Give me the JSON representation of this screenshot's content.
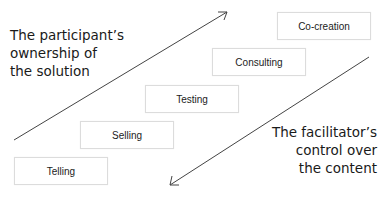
{
  "diagram": {
    "top_left_label": [
      "The participant’s",
      "ownership of",
      "the solution"
    ],
    "bottom_right_label": [
      "The facilitator’s",
      "control over",
      "the content"
    ],
    "steps": [
      {
        "label": "Telling"
      },
      {
        "label": "Selling"
      },
      {
        "label": "Testing"
      },
      {
        "label": "Consulting"
      },
      {
        "label": "Co-creation"
      }
    ],
    "arrows": [
      {
        "name": "participant-ownership-arrow",
        "direction": "up-right"
      },
      {
        "name": "facilitator-control-arrow",
        "direction": "down-left"
      }
    ],
    "colors": {
      "line": "#444444",
      "box_border": "#dcdcdc",
      "text": "#1a1a1a"
    }
  }
}
